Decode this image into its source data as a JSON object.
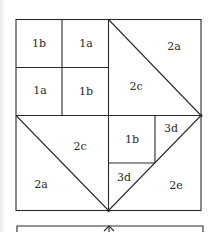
{
  "diagram": {
    "type": "quilt-block-piecing-diagram",
    "labels": {
      "tl_1": "1b",
      "tl_2": "1a",
      "tl_3": "1a",
      "tl_4": "1b",
      "tr_outer": "2a",
      "tr_inner": "2c",
      "bl_inner": "2c",
      "bl_outer": "2a",
      "br_square": "1b",
      "br_3d_top": "3d",
      "br_3d_bottom": "3d",
      "br_outer": "2e"
    },
    "colors": {
      "line": "#2b2b2b",
      "background": "#ffffff",
      "text": "#2a2a2a"
    }
  }
}
